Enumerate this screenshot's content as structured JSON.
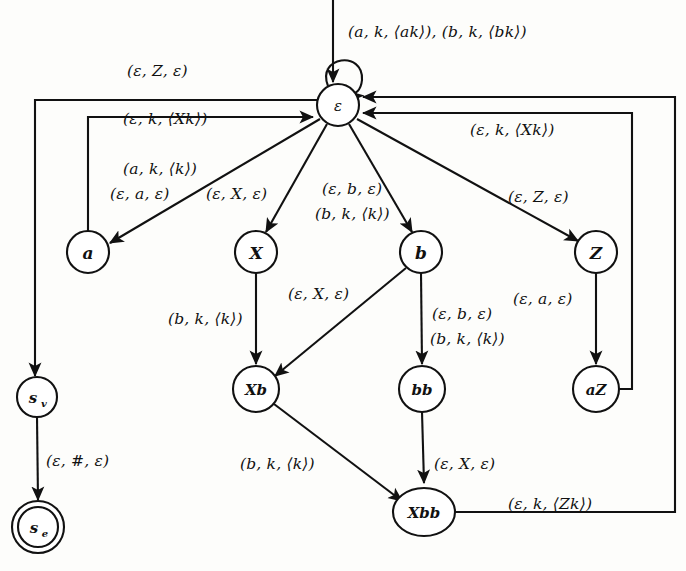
{
  "diagram": {
    "background_color": "#fdfdfb",
    "ink_color": "#111111",
    "states": [
      {
        "id": "eps",
        "label": "ε",
        "x": 338,
        "y": 105,
        "r": 21,
        "accepting": false
      },
      {
        "id": "a",
        "label": "a",
        "x": 88,
        "y": 252,
        "r": 21,
        "accepting": false
      },
      {
        "id": "X",
        "label": "X",
        "x": 256,
        "y": 252,
        "r": 21,
        "accepting": false
      },
      {
        "id": "b",
        "label": "b",
        "x": 421,
        "y": 252,
        "r": 21,
        "accepting": false
      },
      {
        "id": "Z",
        "label": "Z",
        "x": 596,
        "y": 252,
        "r": 21,
        "accepting": false
      },
      {
        "id": "Xb",
        "label": "Xb",
        "x": 256,
        "y": 389,
        "r": 23,
        "accepting": false
      },
      {
        "id": "bb",
        "label": "bb",
        "x": 422,
        "y": 389,
        "r": 23,
        "accepting": false
      },
      {
        "id": "aZ",
        "label": "aZ",
        "x": 596,
        "y": 389,
        "r": 23,
        "accepting": false
      },
      {
        "id": "Xbb",
        "label": "Xbb",
        "x": 424,
        "y": 512,
        "r": 27,
        "accepting": false
      },
      {
        "id": "sv",
        "label": "s",
        "sublabel": "v",
        "x": 37,
        "y": 397,
        "r": 20,
        "accepting": false
      },
      {
        "id": "se",
        "label": "s",
        "sublabel": "e",
        "x": 38,
        "y": 527,
        "r": 20,
        "accepting": true
      }
    ],
    "edge_labels": [
      {
        "id": "selfloop",
        "text": "(a, k, ⟨ak⟩), (b, k, ⟨bk⟩)",
        "x": 348,
        "y": 23
      },
      {
        "id": "eps-to-sv",
        "text": "(ε, Z, ε)",
        "x": 127,
        "y": 62
      },
      {
        "id": "a-to-eps",
        "text": "(ε, k, ⟨Xk⟩)",
        "x": 123,
        "y": 110
      },
      {
        "id": "eps-to-a-1",
        "text": "(a, k, ⟨k⟩)",
        "x": 123,
        "y": 160
      },
      {
        "id": "eps-to-a-2",
        "text": "(ε, a, ε)",
        "x": 110,
        "y": 185
      },
      {
        "id": "eps-to-X",
        "text": "(ε, X, ε)",
        "x": 206,
        "y": 185
      },
      {
        "id": "eps-to-b-1",
        "text": "(ε, b, ε)",
        "x": 322,
        "y": 180
      },
      {
        "id": "eps-to-b-2",
        "text": "(b, k, ⟨k⟩)",
        "x": 315,
        "y": 205
      },
      {
        "id": "aZ-to-eps",
        "text": "(ε, k, ⟨Xk⟩)",
        "x": 470,
        "y": 121
      },
      {
        "id": "eps-to-Z",
        "text": "(ε, Z, ε)",
        "x": 508,
        "y": 188
      },
      {
        "id": "X-to-Xb",
        "text": "(b, k, ⟨k⟩)",
        "x": 168,
        "y": 310
      },
      {
        "id": "b-to-Xb",
        "text": "(ε, X, ε)",
        "x": 288,
        "y": 285
      },
      {
        "id": "b-to-bb-1",
        "text": "(ε, b, ε)",
        "x": 432,
        "y": 305
      },
      {
        "id": "b-to-bb-2",
        "text": "(b, k, ⟨k⟩)",
        "x": 430,
        "y": 330
      },
      {
        "id": "Z-to-aZ",
        "text": "(ε, a, ε)",
        "x": 513,
        "y": 290
      },
      {
        "id": "Xb-to-Xbb",
        "text": "(b, k, ⟨k⟩)",
        "x": 240,
        "y": 455
      },
      {
        "id": "bb-to-Xbb",
        "text": "(ε, X, ε)",
        "x": 434,
        "y": 455
      },
      {
        "id": "Xbb-to-eps",
        "text": "(ε, k, ⟨Zk⟩)",
        "x": 508,
        "y": 495
      },
      {
        "id": "sv-to-se",
        "text": "(ε, #, ε)",
        "x": 46,
        "y": 452
      }
    ],
    "transitions": [
      {
        "from": "start",
        "to": "eps",
        "label": ""
      },
      {
        "from": "eps",
        "to": "eps",
        "label": "(a, k, ⟨ak⟩), (b, k, ⟨bk⟩)"
      },
      {
        "from": "eps",
        "to": "sv",
        "label": "(ε, Z, ε)"
      },
      {
        "from": "a",
        "to": "eps",
        "label": "(ε, k, ⟨Xk⟩)"
      },
      {
        "from": "eps",
        "to": "a",
        "label": "(a, k, ⟨k⟩) (ε, a, ε)"
      },
      {
        "from": "eps",
        "to": "X",
        "label": "(ε, X, ε)"
      },
      {
        "from": "eps",
        "to": "b",
        "label": "(ε, b, ε) (b, k, ⟨k⟩)"
      },
      {
        "from": "eps",
        "to": "Z",
        "label": "(ε, Z, ε)"
      },
      {
        "from": "X",
        "to": "Xb",
        "label": "(b, k, ⟨k⟩)"
      },
      {
        "from": "b",
        "to": "Xb",
        "label": "(ε, X, ε)"
      },
      {
        "from": "b",
        "to": "bb",
        "label": "(ε, b, ε) (b, k, ⟨k⟩)"
      },
      {
        "from": "Z",
        "to": "aZ",
        "label": "(ε, a, ε)"
      },
      {
        "from": "Xb",
        "to": "Xbb",
        "label": "(b, k, ⟨k⟩)"
      },
      {
        "from": "bb",
        "to": "Xbb",
        "label": "(ε, X, ε)"
      },
      {
        "from": "aZ",
        "to": "eps",
        "label": "(ε, k, ⟨Xk⟩)"
      },
      {
        "from": "Xbb",
        "to": "eps",
        "label": "(ε, k, ⟨Zk⟩)"
      },
      {
        "from": "sv",
        "to": "se",
        "label": "(ε, #, ε)"
      }
    ]
  }
}
